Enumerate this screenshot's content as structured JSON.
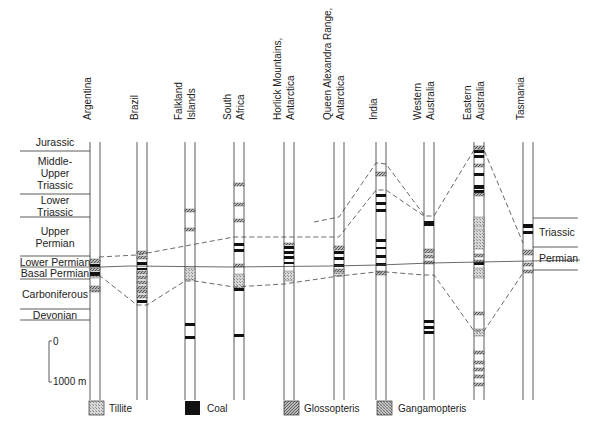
{
  "columns": [
    {
      "name": "Argentina",
      "lines": [
        "Argentina"
      ],
      "x": 90,
      "top": 262,
      "bottom": 400
    },
    {
      "name": "Brazil",
      "lines": [
        "Brazil"
      ],
      "x": 137,
      "top": 231,
      "bottom": 400
    },
    {
      "name": "Falkland Islands",
      "lines": [
        "Falkland",
        "Islands"
      ],
      "x": 185,
      "top": 151,
      "bottom": 400
    },
    {
      "name": "South Africa",
      "lines": [
        "South",
        "Africa"
      ],
      "x": 234,
      "top": 142,
      "bottom": 400
    },
    {
      "name": "Horlick Mountains, Antarctica",
      "lines": [
        "Horlick Mountains,",
        "Antarctica"
      ],
      "x": 284,
      "top": 142,
      "bottom": 400
    },
    {
      "name": "Queen Alexandra Range, Antarctica",
      "lines": [
        "Queen Alexandra Range,",
        "Antarctica"
      ],
      "x": 334,
      "top": 142,
      "bottom": 400
    },
    {
      "name": "India",
      "lines": [
        "India"
      ],
      "x": 376,
      "top": 142,
      "bottom": 400
    },
    {
      "name": "Western Australia",
      "lines": [
        "Western",
        "Australia"
      ],
      "x": 424,
      "top": 142,
      "bottom": 400
    },
    {
      "name": "Eastern Australia",
      "lines": [
        "Eastern",
        "Australia"
      ],
      "x": 474,
      "top": 142,
      "bottom": 400
    },
    {
      "name": "Tasmania",
      "lines": [
        "Tasmania"
      ],
      "x": 523,
      "top": 142,
      "bottom": 400
    }
  ],
  "periods": [
    {
      "label": [
        "Jurassic"
      ],
      "y_top": 142,
      "y_bottom": 151
    },
    {
      "label": [
        "Middle-",
        "Upper",
        "Triassic"
      ],
      "y_top": 151,
      "y_bottom": 194
    },
    {
      "label": [
        "Lower",
        "Triassic"
      ],
      "y_top": 194,
      "y_bottom": 217
    },
    {
      "label": [
        "Upper",
        "Permian"
      ],
      "y_top": 217,
      "y_bottom": 256
    },
    {
      "label": [
        "Lower Permian"
      ],
      "y_top": 256,
      "y_bottom": 267
    },
    {
      "label": [
        "Basal Permian"
      ],
      "y_top": 267,
      "y_bottom": 279
    },
    {
      "label": [
        "Carboniferous"
      ],
      "y_top": 279,
      "y_bottom": 309
    },
    {
      "label": [
        "Devonian"
      ],
      "y_top": 309,
      "y_bottom": 320
    }
  ],
  "tasmania_labels": [
    "Triassic",
    "Permian"
  ],
  "scale_bar": {
    "top_label": "0",
    "bottom_label": "1000 m"
  },
  "legend": [
    {
      "key": "tillite",
      "label": "Tillite"
    },
    {
      "key": "coal",
      "label": "Coal"
    },
    {
      "key": "glossopteris",
      "label": "Glossopteris"
    },
    {
      "key": "gangamopteris",
      "label": "Gangamopteris"
    }
  ]
}
